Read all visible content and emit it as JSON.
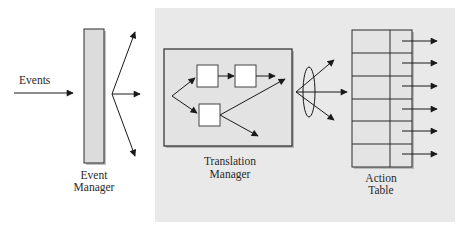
{
  "colors": {
    "background": "#ffffff",
    "panel": "#e9e9e9",
    "bar_fill": "#dcdcdc",
    "stroke": "#2b2b2b",
    "box_fill": "#ffffff",
    "table_fill": "#e4e4e4"
  },
  "input": {
    "label": "Events"
  },
  "event_manager": {
    "label_line1": "Event",
    "label_line2": "Manager"
  },
  "translation_manager": {
    "label_line1": "Translation",
    "label_line2": "Manager",
    "inner_boxes": 3
  },
  "action_table": {
    "label_line1": "Action",
    "label_line2": "Table",
    "rows": 6,
    "columns": 2
  }
}
